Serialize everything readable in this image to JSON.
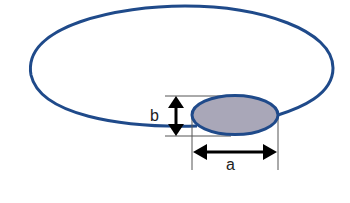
{
  "diagram": {
    "labels": {
      "a": "a",
      "b": "b"
    },
    "colors": {
      "loop_stroke": "#1f4a8a",
      "ellipse_fill": "#a9a7b8",
      "arrow": "#000000",
      "guide": "#555555"
    }
  }
}
